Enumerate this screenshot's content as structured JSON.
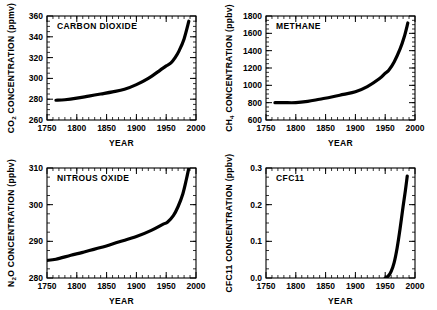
{
  "figure": {
    "panel_count": 4,
    "line_color": "#000000",
    "background_color": "#ffffff"
  },
  "chart_data": [
    {
      "id": "carbon-dioxide",
      "type": "line",
      "title": "CARBON DIOXIDE",
      "xlabel": "YEAR",
      "ylabel": "CO2 CONCENTRATION (ppmv)",
      "ylabel_main": "CO",
      "ylabel_sub": "2",
      "ylabel_rest": " CONCENTRATION (ppmv)",
      "xlim": [
        1750,
        2000
      ],
      "ylim": [
        260,
        360
      ],
      "xticks": [
        1750,
        1800,
        1850,
        1900,
        1950,
        2000
      ],
      "yticks": [
        260,
        280,
        300,
        320,
        340,
        360
      ],
      "xtick_labels": [
        "1750",
        "1800",
        "1850",
        "1900",
        "1950",
        "2000"
      ],
      "ytick_labels": [
        "260",
        "280",
        "300",
        "320",
        "340",
        "360"
      ],
      "x_minor_step": 10,
      "y_minor_step": 5,
      "grid": false,
      "legend": "none",
      "x": [
        1765,
        1780,
        1800,
        1820,
        1840,
        1860,
        1880,
        1900,
        1920,
        1940,
        1950,
        1958,
        1965,
        1972,
        1980,
        1988
      ],
      "values": [
        279,
        279.5,
        281,
        283,
        285,
        287,
        289.5,
        294,
        300,
        308,
        312,
        315,
        320,
        327,
        338,
        355
      ]
    },
    {
      "id": "methane",
      "type": "line",
      "title": "METHANE",
      "xlabel": "YEAR",
      "ylabel": "CH4 CONCENTRATION (ppbv)",
      "ylabel_main": "CH",
      "ylabel_sub": "4",
      "ylabel_rest": " CONCENTRATION (ppbv)",
      "xlim": [
        1750,
        2000
      ],
      "ylim": [
        600,
        1800
      ],
      "xticks": [
        1750,
        1800,
        1850,
        1900,
        1950,
        2000
      ],
      "yticks": [
        600,
        800,
        1000,
        1200,
        1400,
        1600,
        1800
      ],
      "xtick_labels": [
        "600",
        "800",
        "1000",
        "1200",
        "1400",
        "1600",
        "1800"
      ],
      "ytick_labels": [
        "600",
        "800",
        "1000",
        "1200",
        "1400",
        "1600",
        "1800"
      ],
      "x_minor_step": 10,
      "y_minor_step": 50,
      "grid": false,
      "legend": "none",
      "x": [
        1765,
        1780,
        1800,
        1820,
        1840,
        1860,
        1880,
        1900,
        1920,
        1940,
        1950,
        1956,
        1965,
        1975,
        1982,
        1988
      ],
      "values": [
        800,
        800,
        800,
        815,
        840,
        865,
        895,
        925,
        985,
        1075,
        1140,
        1175,
        1270,
        1420,
        1560,
        1720
      ]
    },
    {
      "id": "nitrous-oxide",
      "type": "line",
      "title": "NITROUS OXIDE",
      "xlabel": "YEAR",
      "ylabel": "N2O CONCENTRATION (ppbv)",
      "ylabel_main": "N",
      "ylabel_sub": "2",
      "ylabel_rest": "O CONCENTRATION (ppbv)",
      "xlim": [
        1750,
        2000
      ],
      "ylim": [
        280,
        310
      ],
      "xticks": [
        1750,
        1800,
        1850,
        1900,
        1950,
        2000
      ],
      "yticks": [
        280,
        290,
        300,
        310
      ],
      "xtick_labels": [
        "1750",
        "1800",
        "1850",
        "1900",
        "1950",
        "2000"
      ],
      "ytick_labels": [
        "280",
        "290",
        "300",
        "310"
      ],
      "x_minor_step": 10,
      "y_minor_step": 2.5,
      "grid": false,
      "legend": "none",
      "x": [
        1750,
        1765,
        1790,
        1810,
        1840,
        1870,
        1900,
        1925,
        1945,
        1952,
        1962,
        1970,
        1978,
        1984,
        1988
      ],
      "values": [
        284.8,
        285.1,
        286.2,
        287.0,
        288.3,
        289.8,
        291.3,
        293.0,
        294.7,
        295.2,
        297.0,
        299.5,
        303.0,
        307.0,
        310.0
      ]
    },
    {
      "id": "cfc11",
      "type": "line",
      "title": "CFC11",
      "xlabel": "YEAR",
      "ylabel": "CFC11 CONCENTRATION (ppbv)",
      "ylabel_main": "CFC11 CONCENTRATION (ppbv)",
      "ylabel_sub": "",
      "ylabel_rest": "",
      "xlim": [
        1750,
        2000
      ],
      "ylim": [
        0,
        0.3
      ],
      "xticks": [
        1750,
        1800,
        1850,
        1900,
        1950,
        2000
      ],
      "yticks": [
        0.0,
        0.1,
        0.2,
        0.3
      ],
      "xtick_labels": [
        "1750",
        "1800",
        "1850",
        "1900",
        "1950",
        "2000"
      ],
      "ytick_labels": [
        "0.0",
        "0.1",
        "0.2",
        "0.3"
      ],
      "x_minor_step": 10,
      "y_minor_step": 0.025,
      "grid": false,
      "legend": "none",
      "x": [
        1950,
        1955,
        1960,
        1965,
        1970,
        1975,
        1980,
        1984,
        1987
      ],
      "values": [
        0.0,
        0.005,
        0.018,
        0.042,
        0.082,
        0.135,
        0.195,
        0.24,
        0.278
      ]
    }
  ]
}
